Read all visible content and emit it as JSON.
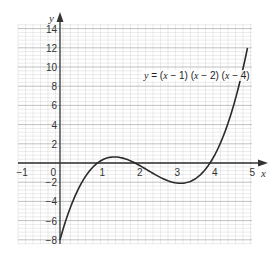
{
  "chart_data": {
    "type": "line",
    "title": "",
    "xlabel": "x",
    "ylabel": "y",
    "xlim": [
      -1,
      5
    ],
    "ylim": [
      -8,
      14
    ],
    "x_ticks": [
      -1,
      0,
      1,
      2,
      3,
      4,
      5
    ],
    "y_ticks": [
      -8,
      -6,
      -4,
      -2,
      2,
      4,
      6,
      8,
      10,
      12,
      14
    ],
    "grid": true,
    "grid_minor_step_x": 0.2,
    "grid_minor_step_y": 0.4,
    "series": [
      {
        "name": "y = (x − 1) (x − 2) (x − 4)",
        "x": [
          0,
          0.25,
          0.5,
          0.75,
          1,
          1.25,
          1.5,
          1.75,
          2,
          2.25,
          2.5,
          2.75,
          3,
          3.25,
          3.5,
          3.75,
          4,
          4.25,
          4.5,
          4.75,
          5
        ],
        "values": [
          -8,
          -4.92,
          -2.63,
          -1.02,
          0,
          0.55,
          0.63,
          0.42,
          0,
          -0.55,
          -1.13,
          -1.64,
          -2,
          -2.11,
          -1.88,
          -1.2,
          0,
          1.8,
          4.38,
          7.83,
          12
        ]
      }
    ],
    "annotations": [
      {
        "text": "y = (x − 1) (x − 2) (x − 4)",
        "x": 2.4,
        "y": 10
      }
    ]
  },
  "labels": {
    "x_axis": "x",
    "y_axis": "y",
    "equation_parts": [
      "y",
      " = (",
      "x",
      " − 1) (",
      "x",
      " − 2) (",
      "x",
      " − 4)"
    ],
    "x_tick_labels": [
      "−1",
      "0",
      "1",
      "2",
      "3",
      "4",
      "5"
    ],
    "y_tick_labels": [
      "14",
      "12",
      "10",
      "8",
      "6",
      "4",
      "2",
      "−2",
      "−4",
      "−6",
      "−8"
    ]
  },
  "colors": {
    "grid_minor": "#d6d6d6",
    "grid_major": "#b0b0b0",
    "axis": "#333333",
    "curve": "#2a2a2a"
  }
}
